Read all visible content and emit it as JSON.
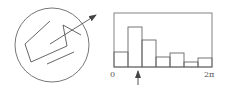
{
  "colors": {
    "stroke": "#555555",
    "background": "#ffffff"
  },
  "left_diagram": {
    "description": "circle with polyline path and outgoing arrow",
    "circle": {
      "cx": 52,
      "cy": 45,
      "r": 37
    },
    "polyline": "50,21 25,44 31,62 67,46 63,25 81,35",
    "arrow_line": {
      "x1": 50,
      "y1": 44,
      "x2": 96,
      "y2": 15
    },
    "segment": {
      "x1": 47,
      "y1": 64,
      "x2": 74,
      "y2": 52
    }
  },
  "histogram": {
    "x_axis_labels": {
      "start": "0",
      "end": "2π"
    },
    "frame": {
      "x": 114,
      "y": 13,
      "w": 98,
      "h": 54
    },
    "baseline_y": 67,
    "bars": [
      {
        "x": 114,
        "w": 14,
        "top": 52
      },
      {
        "x": 128,
        "w": 14,
        "top": 27
      },
      {
        "x": 142,
        "w": 14,
        "top": 40
      },
      {
        "x": 156,
        "w": 14,
        "top": 57
      },
      {
        "x": 170,
        "w": 14,
        "top": 53
      },
      {
        "x": 184,
        "w": 14,
        "top": 62
      },
      {
        "x": 198,
        "w": 14,
        "top": 58
      }
    ],
    "marker_arrow": {
      "x": 138,
      "y_from": 85,
      "y_to": 71
    }
  },
  "chart_data": {
    "type": "bar",
    "title": "",
    "xlabel": "",
    "ylabel": "",
    "x_range_labels": [
      "0",
      "2π"
    ],
    "categories": [
      "bin1",
      "bin2",
      "bin3",
      "bin4",
      "bin5",
      "bin6",
      "bin7"
    ],
    "values": [
      15,
      40,
      27,
      10,
      14,
      5,
      9
    ],
    "annotations": [
      "upward arrow under bin2 (peak)"
    ]
  }
}
